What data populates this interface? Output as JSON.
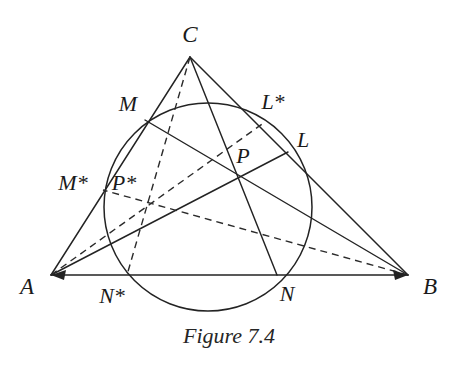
{
  "figure": {
    "caption": "Figure 7.4",
    "caption_x": 216,
    "caption_y": 323,
    "width": 458,
    "height": 368,
    "background": "#ffffff",
    "line_color": "#232323",
    "dash_color": "#2b2b2b",
    "label_color": "#1a1a1a"
  },
  "vertices": [
    {
      "id": "A",
      "label": "A",
      "x": 51,
      "y": 275,
      "label_x": 27,
      "label_y": 286
    },
    {
      "id": "B",
      "label": "B",
      "x": 408,
      "y": 275,
      "label_x": 430,
      "label_y": 286
    },
    {
      "id": "C",
      "label": "C",
      "x": 190,
      "y": 57,
      "label_x": 190,
      "label_y": 34
    }
  ],
  "points": [
    {
      "id": "M",
      "label": "M",
      "x": 145,
      "y": 120,
      "label_x": 128,
      "label_y": 104,
      "on": "AC"
    },
    {
      "id": "L",
      "label": "L",
      "x": 288,
      "y": 152,
      "label_x": 303,
      "label_y": 140,
      "on": "BC"
    },
    {
      "id": "N",
      "label": "N",
      "x": 277,
      "y": 275,
      "label_x": 287,
      "label_y": 294,
      "on": "AB"
    },
    {
      "id": "P",
      "label": "P",
      "x": 240,
      "y": 177,
      "label_x": 243,
      "label_y": 156,
      "on": "cevian-intersection"
    },
    {
      "id": "Mstar",
      "label": "M*",
      "x": 103,
      "y": 190,
      "label_x": 73,
      "label_y": 183,
      "on": "AC"
    },
    {
      "id": "Lstar",
      "label": "L*",
      "x": 265,
      "y": 122,
      "label_x": 273,
      "label_y": 102,
      "on": "BC"
    },
    {
      "id": "Nstar",
      "label": "N*",
      "x": 127,
      "y": 275,
      "label_x": 112,
      "label_y": 296,
      "on": "AB"
    },
    {
      "id": "Pstar",
      "label": "P*",
      "x": 145,
      "y": 203,
      "label_x": 124,
      "label_y": 183,
      "on": "dashed-cevian-intersection"
    }
  ],
  "circle": {
    "label": "circumscribed-circle",
    "cx": 208,
    "cy": 207,
    "r": 104
  },
  "segments": {
    "triangle_sides": [
      {
        "name": "side-AB",
        "x1": 51,
        "y1": 275,
        "x2": 408,
        "y2": 275
      },
      {
        "name": "side-AC",
        "x1": 51,
        "y1": 275,
        "x2": 190,
        "y2": 57
      },
      {
        "name": "side-BC",
        "x1": 408,
        "y1": 275,
        "x2": 190,
        "y2": 57
      }
    ],
    "cevians_solid": [
      {
        "name": "cevian-A-to-L",
        "x1": 51,
        "y1": 275,
        "x2": 288,
        "y2": 152
      },
      {
        "name": "cevian-B-to-M",
        "x1": 408,
        "y1": 275,
        "x2": 145,
        "y2": 120
      },
      {
        "name": "cevian-C-to-N",
        "x1": 190,
        "y1": 57,
        "x2": 277,
        "y2": 275
      }
    ],
    "cevians_dashed": [
      {
        "name": "cevian-A-to-Lstar",
        "x1": 51,
        "y1": 275,
        "x2": 265,
        "y2": 122
      },
      {
        "name": "cevian-B-to-Mstar",
        "x1": 408,
        "y1": 275,
        "x2": 103,
        "y2": 190
      },
      {
        "name": "cevian-C-to-Nstar",
        "x1": 190,
        "y1": 57,
        "x2": 127,
        "y2": 275
      }
    ]
  },
  "arrowheads": [
    {
      "name": "arrow-at-A",
      "x": 51,
      "y": 275
    },
    {
      "name": "arrow-at-B",
      "x": 408,
      "y": 275
    }
  ]
}
